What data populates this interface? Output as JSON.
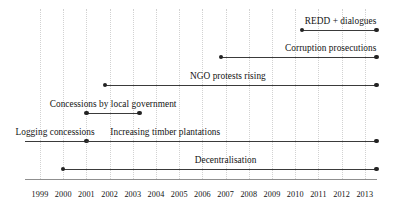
{
  "chart_data": {
    "type": "timeline",
    "title": "",
    "subtitle": "",
    "xlabel": "",
    "ylabel": "",
    "xlim": [
      1998.35,
      1998.35
    ],
    "grid": true,
    "grid_axis": "x",
    "legend": "none",
    "axis_color": "#8f8f8f",
    "grid_color": "#d2d2d2",
    "bar_color": "#3a3a3a",
    "marker_color": "#232323",
    "text_color": "#131313",
    "background": "#ffffff",
    "tick_labels": [
      "1999",
      "2000",
      "2001",
      "2002",
      "2003",
      "2004",
      "2005",
      "2006",
      "2007",
      "2008",
      "2009",
      "2010",
      "2011",
      "2012",
      "2013"
    ],
    "tick_values": [
      1999,
      2000,
      2001,
      2002,
      2003,
      2004,
      2005,
      2006,
      2007,
      2008,
      2009,
      2010,
      2011,
      2012,
      2013
    ],
    "tasks": [
      {
        "label": "REDD + dialogues",
        "start": 2010.3,
        "end": 2013.5,
        "start_marker": true,
        "end_marker": true,
        "label_anchor": "right",
        "label_at": 2013.5,
        "row": 1
      },
      {
        "label": "Corruption prosecutions",
        "start": 2006.8,
        "end": 2013.5,
        "start_marker": true,
        "end_marker": true,
        "label_anchor": "right",
        "label_at": 2013.5,
        "row": 2
      },
      {
        "label": "NGO protests rising",
        "start": 2001.8,
        "end": 2013.5,
        "start_marker": true,
        "end_marker": true,
        "label_anchor": "center",
        "label_at": 2007.1,
        "row": 3
      },
      {
        "label": "Concessions by local government",
        "start": 2001.0,
        "end": 2003.3,
        "start_marker": true,
        "end_marker": true,
        "label_anchor": "center",
        "label_at": 2002.15,
        "row": 4
      },
      {
        "label": "Logging concessions",
        "start": 1998.35,
        "end": 2001.0,
        "start_marker": false,
        "end_marker": true,
        "label_anchor": "center",
        "label_at": 1999.65,
        "row": 5
      },
      {
        "label": "Increasing timber plantations",
        "start": 2001.0,
        "end": 2013.5,
        "start_marker": false,
        "end_marker": true,
        "label_anchor": "center",
        "label_at": 2004.4,
        "row": 5
      },
      {
        "label": "Decentralisation",
        "start": 2000.0,
        "end": 2013.5,
        "start_marker": true,
        "end_marker": true,
        "label_anchor": "center",
        "label_at": 2007.0,
        "row": 6
      }
    ]
  }
}
